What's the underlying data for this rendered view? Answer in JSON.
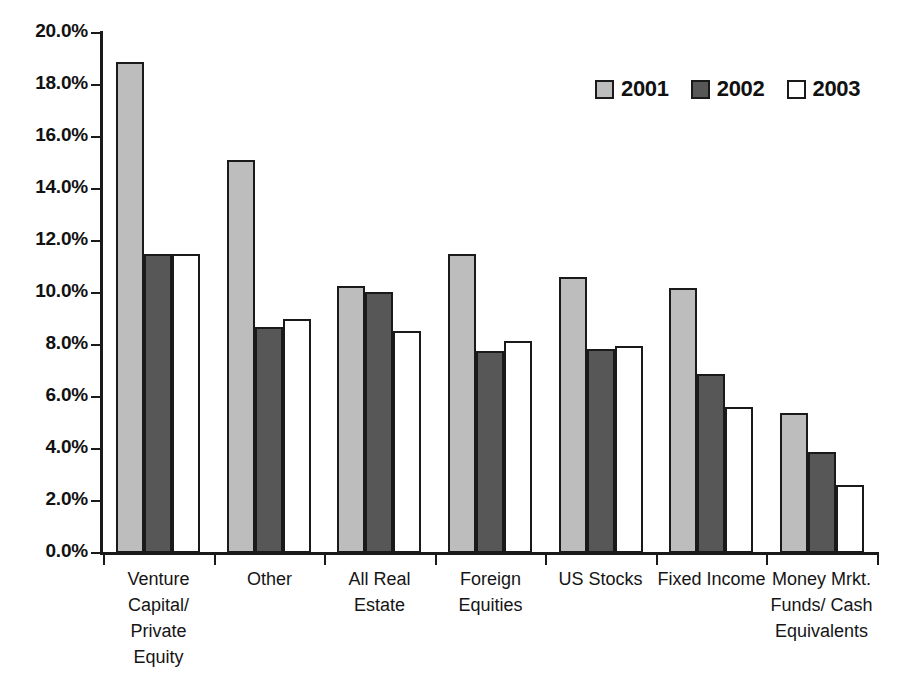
{
  "chart_data": {
    "type": "bar",
    "title": "",
    "xlabel": "",
    "ylabel": "",
    "ylim": [
      0,
      20
    ],
    "ytick_values": [
      20,
      18,
      16,
      14,
      12,
      10,
      8,
      6,
      4,
      2,
      0
    ],
    "ytick_labels": [
      "20.0%",
      "18.0%",
      "16.0%",
      "14.0%",
      "12.0%",
      "10.0%",
      "8.0%",
      "6.0%",
      "4.0%",
      "2.0%",
      "0.0%"
    ],
    "grid": false,
    "legend_position": "top-right",
    "categories": [
      "Venture\nCapital/\nPrivate\nEquity",
      "Other",
      "All Real\nEstate",
      "Foreign\nEquities",
      "US Stocks",
      "Fixed Income",
      "Money Mrkt.\nFunds/ Cash\nEquivalents"
    ],
    "series": [
      {
        "name": "2001",
        "color": "#bdbdbd",
        "values": [
          18.9,
          15.1,
          10.25,
          11.5,
          10.6,
          10.2,
          5.4
        ]
      },
      {
        "name": "2002",
        "color": "#575757",
        "values": [
          11.5,
          8.7,
          10.05,
          7.75,
          7.85,
          6.9,
          3.9
        ]
      },
      {
        "name": "2003",
        "color": "#ffffff",
        "values": [
          11.5,
          9.0,
          8.55,
          8.15,
          7.95,
          5.6,
          2.6
        ]
      }
    ]
  }
}
